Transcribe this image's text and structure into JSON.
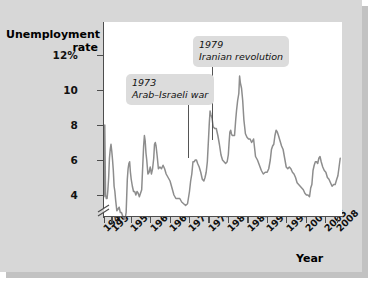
{
  "chart_data": {
    "type": "line",
    "title": "",
    "ylabel": "Unemployment rate",
    "xlabel": "Year",
    "ylim": [
      3.0,
      12.8
    ],
    "xlim": [
      1948,
      2009
    ],
    "grid": false,
    "legend": "none",
    "y_axis_break": true,
    "y_ticks": [
      {
        "value": 12,
        "label": "12%"
      },
      {
        "value": 10,
        "label": "10"
      },
      {
        "value": 8,
        "label": "8"
      },
      {
        "value": 6,
        "label": "6"
      },
      {
        "value": 4,
        "label": "4"
      }
    ],
    "x_ticks": [
      {
        "value": 1948,
        "label": "1948"
      },
      {
        "value": 1950,
        "label": "1950"
      },
      {
        "value": 1955,
        "label": "1955"
      },
      {
        "value": 1960,
        "label": "1960"
      },
      {
        "value": 1965,
        "label": "1965"
      },
      {
        "value": 1970,
        "label": "1970"
      },
      {
        "value": 1975,
        "label": "1975"
      },
      {
        "value": 1980,
        "label": "1980"
      },
      {
        "value": 1985,
        "label": "1985"
      },
      {
        "value": 1990,
        "label": "1990"
      },
      {
        "value": 1995,
        "label": "1995"
      },
      {
        "value": 2000,
        "label": "2000"
      },
      {
        "value": 2005,
        "label": "2005"
      },
      {
        "value": 2008,
        "label": "2008"
      }
    ],
    "series": [
      {
        "name": "Unemployment rate",
        "color": "#8d8d8d",
        "x": [
          1948.0,
          1948.2,
          1948.4,
          1948.6,
          1948.8,
          1949.0,
          1949.2,
          1949.4,
          1949.6,
          1949.8,
          1950.0,
          1950.2,
          1950.4,
          1950.6,
          1950.8,
          1951.0,
          1951.3,
          1951.6,
          1951.9,
          1952.2,
          1952.5,
          1952.8,
          1953.1,
          1953.4,
          1953.7,
          1954.0,
          1954.2,
          1954.4,
          1954.6,
          1954.8,
          1955.0,
          1955.3,
          1955.6,
          1955.9,
          1956.2,
          1956.5,
          1956.8,
          1957.1,
          1957.4,
          1957.7,
          1958.0,
          1958.2,
          1958.4,
          1958.6,
          1958.8,
          1959.0,
          1959.3,
          1959.6,
          1959.9,
          1960.2,
          1960.5,
          1960.8,
          1961.0,
          1961.2,
          1961.4,
          1961.7,
          1962.0,
          1962.4,
          1962.8,
          1963.2,
          1963.6,
          1964.0,
          1964.5,
          1965.0,
          1965.5,
          1966.0,
          1966.5,
          1967.0,
          1967.5,
          1968.0,
          1968.5,
          1969.0,
          1969.5,
          1970.0,
          1970.3,
          1970.6,
          1970.9,
          1971.2,
          1971.5,
          1971.8,
          1972.1,
          1972.5,
          1972.9,
          1973.3,
          1973.7,
          1974.0,
          1974.3,
          1974.6,
          1974.9,
          1975.1,
          1975.3,
          1975.5,
          1975.8,
          1976.1,
          1976.5,
          1976.9,
          1977.3,
          1977.7,
          1978.1,
          1978.5,
          1978.9,
          1979.3,
          1979.7,
          1980.0,
          1980.2,
          1980.4,
          1980.6,
          1980.8,
          1981.0,
          1981.3,
          1981.6,
          1981.9,
          1982.1,
          1982.4,
          1982.7,
          1982.9,
          1983.1,
          1983.4,
          1983.7,
          1984.0,
          1984.4,
          1984.8,
          1985.2,
          1985.6,
          1986.0,
          1986.5,
          1987.0,
          1987.5,
          1988.0,
          1988.5,
          1989.0,
          1989.5,
          1990.0,
          1990.4,
          1990.8,
          1991.1,
          1991.4,
          1991.7,
          1992.0,
          1992.3,
          1992.6,
          1992.9,
          1993.3,
          1993.7,
          1994.1,
          1994.5,
          1994.9,
          1995.3,
          1995.7,
          1996.1,
          1996.5,
          1996.9,
          1997.3,
          1997.7,
          1998.1,
          1998.5,
          1998.9,
          1999.3,
          1999.7,
          2000.1,
          2000.5,
          2000.9,
          2001.2,
          2001.5,
          2001.8,
          2002.1,
          2002.4,
          2002.7,
          2003.0,
          2003.3,
          2003.6,
          2003.9,
          2004.3,
          2004.7,
          2005.1,
          2005.5,
          2005.9,
          2006.3,
          2006.7,
          2007.1,
          2007.5,
          2007.9,
          2008.2,
          2008.5,
          2008.8
        ],
        "y": [
          3.9,
          8.0,
          4.0,
          3.8,
          3.8,
          4.3,
          5.0,
          6.1,
          6.6,
          6.9,
          6.5,
          6.0,
          5.4,
          4.5,
          4.2,
          3.7,
          3.1,
          3.2,
          3.3,
          3.0,
          3.0,
          2.8,
          2.7,
          2.6,
          3.0,
          4.9,
          5.5,
          5.8,
          5.9,
          5.3,
          4.9,
          4.5,
          4.2,
          4.2,
          4.0,
          4.2,
          4.1,
          3.9,
          4.1,
          4.3,
          5.8,
          6.8,
          7.4,
          7.1,
          6.4,
          6.0,
          5.2,
          5.3,
          5.6,
          5.2,
          5.5,
          6.1,
          6.9,
          7.0,
          6.8,
          6.2,
          5.5,
          5.6,
          5.5,
          5.7,
          5.5,
          5.2,
          5.0,
          4.8,
          4.4,
          4.0,
          3.8,
          3.8,
          3.8,
          3.6,
          3.5,
          3.4,
          3.5,
          4.2,
          4.8,
          5.2,
          5.9,
          5.9,
          6.0,
          6.0,
          5.8,
          5.6,
          5.3,
          4.9,
          4.8,
          5.0,
          5.3,
          5.9,
          7.2,
          8.1,
          8.8,
          8.6,
          8.4,
          7.9,
          7.8,
          7.8,
          7.4,
          6.9,
          6.3,
          6.0,
          5.9,
          5.8,
          5.9,
          6.3,
          7.0,
          7.6,
          7.7,
          7.5,
          7.4,
          7.4,
          7.4,
          8.3,
          8.8,
          9.4,
          9.8,
          10.8,
          10.4,
          10.1,
          9.4,
          8.3,
          7.5,
          7.3,
          7.2,
          7.2,
          7.0,
          7.2,
          6.2,
          6.0,
          5.7,
          5.4,
          5.2,
          5.3,
          5.3,
          5.5,
          6.0,
          6.6,
          6.8,
          6.9,
          7.4,
          7.7,
          7.6,
          7.4,
          7.1,
          6.8,
          6.6,
          6.1,
          5.6,
          5.5,
          5.6,
          5.5,
          5.3,
          5.2,
          5.0,
          4.7,
          4.6,
          4.5,
          4.4,
          4.3,
          4.1,
          4.0,
          4.0,
          3.9,
          4.4,
          4.6,
          5.4,
          5.7,
          5.9,
          5.9,
          5.8,
          6.1,
          6.2,
          5.9,
          5.6,
          5.4,
          5.3,
          5.0,
          4.9,
          4.7,
          4.5,
          4.6,
          4.6,
          4.9,
          5.1,
          5.6,
          6.1
        ]
      }
    ],
    "annotations": [
      {
        "id": "annot-1973",
        "year": "1973",
        "text": "Arab–Israeli war",
        "points_to_year": 1973.5
      },
      {
        "id": "annot-1979",
        "year": "1979",
        "text": "Iranian revolution",
        "points_to_year": 1979.5
      }
    ]
  },
  "labels": {
    "y_title_line1": "Unemployment",
    "y_title_line2": "rate",
    "x_title": "Year"
  },
  "colors": {
    "panel_background": "#d7d7d7",
    "plot_background": "#ffffff",
    "line": "#8d8d8d",
    "axis": "#4d4d4d",
    "annotation_box": "#dcdcdc",
    "text": "#111111"
  }
}
